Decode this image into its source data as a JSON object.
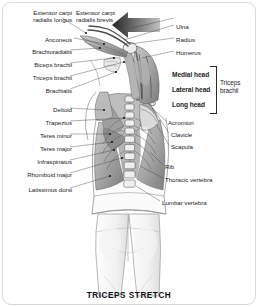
{
  "figure": {
    "caption": "TRICEPS STRETCH",
    "background_color": "#ffffff",
    "border_color": "#d8d8d8",
    "ink_color": "#1c1c1c"
  },
  "arrow": {
    "name": "motion-arrow",
    "direction": "left-down",
    "color_dark": "#2b2b2b",
    "color_light": "#b9b9b9"
  },
  "labels_left": [
    {
      "text": "Extensor carpi\nradialis longus",
      "x": 6,
      "y": 9
    },
    {
      "text": "Anconeus",
      "x": 36,
      "y": 36
    },
    {
      "text": "Brachioradialis",
      "x": 14,
      "y": 48
    },
    {
      "text": "Biceps brachii",
      "x": 18,
      "y": 61
    },
    {
      "text": "Triceps brachii",
      "x": 16,
      "y": 74
    },
    {
      "text": "Brachialis",
      "x": 33,
      "y": 87
    },
    {
      "text": "Deltoid",
      "x": 42,
      "y": 106
    },
    {
      "text": "Trapezius",
      "x": 30,
      "y": 119
    },
    {
      "text": "Teres minor",
      "x": 22,
      "y": 132
    },
    {
      "text": "Teres major",
      "x": 22,
      "y": 145
    },
    {
      "text": "Infraspinatus",
      "x": 17,
      "y": 158
    },
    {
      "text": "Rhomboid major",
      "x": 6,
      "y": 171
    },
    {
      "text": "Latissimus dorsi",
      "x": 8,
      "y": 186
    }
  ],
  "labels_right": [
    {
      "text": "Extensor carpi\nradialis brevis",
      "x": 76,
      "y": 9
    },
    {
      "text": "Ulna",
      "x": 176,
      "y": 23
    },
    {
      "text": "Radius",
      "x": 176,
      "y": 36
    },
    {
      "text": "Humerus",
      "x": 176,
      "y": 49
    },
    {
      "text": "Acromion",
      "x": 168,
      "y": 119
    },
    {
      "text": "Clavicle",
      "x": 171,
      "y": 131
    },
    {
      "text": "Scapula",
      "x": 171,
      "y": 143
    },
    {
      "text": "Rib",
      "x": 165,
      "y": 163
    },
    {
      "text": "Thoracic vertebra",
      "x": 165,
      "y": 176
    },
    {
      "text": "Lumbar vertebra",
      "x": 162,
      "y": 199
    }
  ],
  "triceps_group": {
    "heads": [
      {
        "text": "Medial head",
        "x": 172,
        "y": 71
      },
      {
        "text": "Lateral head",
        "x": 172,
        "y": 86
      },
      {
        "text": "Long head",
        "x": 172,
        "y": 101
      }
    ],
    "group_label": "Triceps\nbrachii",
    "group_label_x": 220,
    "group_label_y": 79
  }
}
